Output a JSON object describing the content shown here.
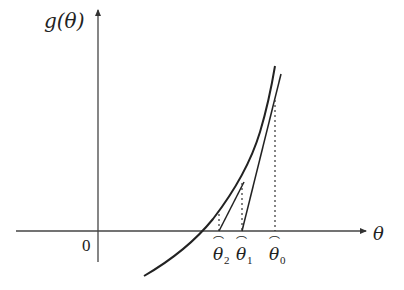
{
  "diagram": {
    "y_axis_label": "g(θ)",
    "x_axis_label": "θ",
    "origin_label": "0",
    "points": [
      {
        "name": "theta0",
        "symbol": "θ",
        "hat": "⌒",
        "subscript": "0"
      },
      {
        "name": "theta1",
        "symbol": "θ",
        "hat": "⌒",
        "subscript": "1"
      },
      {
        "name": "theta2",
        "symbol": "θ",
        "hat": "⌒",
        "subscript": "2"
      }
    ],
    "colors": {
      "line": "#222222",
      "background": "#ffffff"
    }
  }
}
